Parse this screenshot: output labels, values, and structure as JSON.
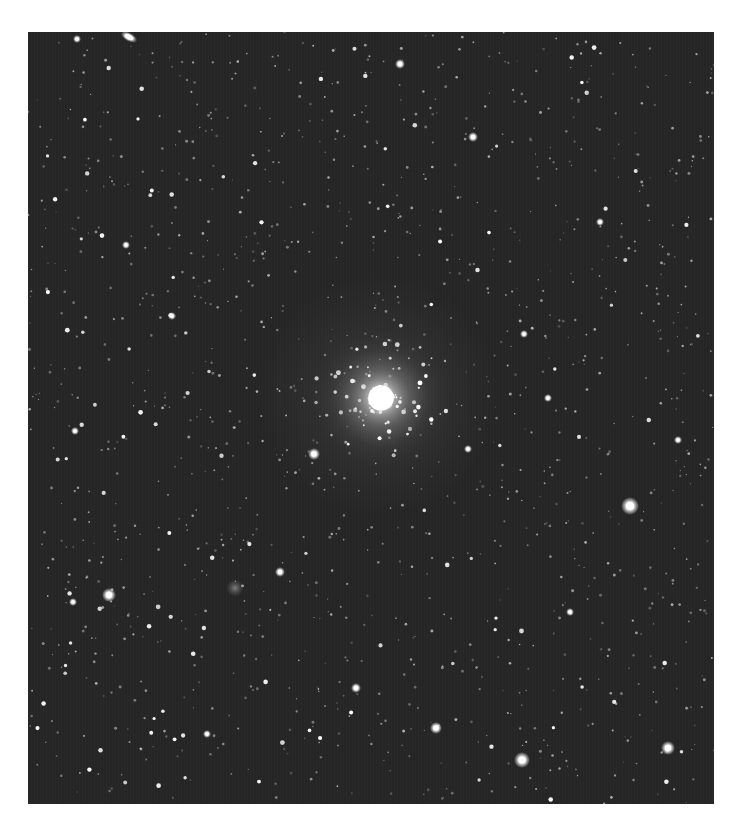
{
  "image": {
    "subject": "star field with globular cluster",
    "colors": {
      "page_background": "#ffffff",
      "sky_background": "#262626",
      "star": "#ffffff"
    },
    "frame": {
      "x": 28,
      "y": 32,
      "width": 686,
      "height": 772
    },
    "cluster": {
      "cx": 353,
      "cy": 366,
      "core_radius": 16,
      "halo_radius": 70
    },
    "bright_stars": [
      {
        "x": 129,
        "y": 37,
        "r": 4,
        "elongated": true
      },
      {
        "x": 400,
        "y": 64,
        "r": 2.5
      },
      {
        "x": 77,
        "y": 39,
        "r": 2
      },
      {
        "x": 473,
        "y": 137,
        "r": 2.5
      },
      {
        "x": 126,
        "y": 245,
        "r": 2
      },
      {
        "x": 314,
        "y": 454,
        "r": 3
      },
      {
        "x": 630,
        "y": 506,
        "r": 4.5
      },
      {
        "x": 109,
        "y": 595,
        "r": 3.5
      },
      {
        "x": 280,
        "y": 572,
        "r": 2.5
      },
      {
        "x": 235,
        "y": 588,
        "r": 4,
        "diffuse": true
      },
      {
        "x": 356,
        "y": 688,
        "r": 2.5
      },
      {
        "x": 436,
        "y": 728,
        "r": 3
      },
      {
        "x": 522,
        "y": 760,
        "r": 4
      },
      {
        "x": 668,
        "y": 748,
        "r": 3.5
      },
      {
        "x": 524,
        "y": 334,
        "r": 2
      },
      {
        "x": 73,
        "y": 602,
        "r": 2
      },
      {
        "x": 548,
        "y": 398,
        "r": 2
      },
      {
        "x": 468,
        "y": 449,
        "r": 2
      },
      {
        "x": 172,
        "y": 316,
        "r": 2
      },
      {
        "x": 75,
        "y": 431,
        "r": 2
      },
      {
        "x": 678,
        "y": 440,
        "r": 2
      },
      {
        "x": 570,
        "y": 612,
        "r": 2
      },
      {
        "x": 207,
        "y": 734,
        "r": 2
      },
      {
        "x": 600,
        "y": 222,
        "r": 2
      }
    ],
    "faint_star_count": 1400,
    "cluster_member_count": 90,
    "seed": 20240
  }
}
